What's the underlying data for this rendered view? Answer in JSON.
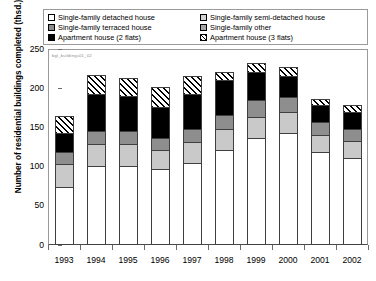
{
  "legend": {
    "items": [
      {
        "label": "Single-family detached house",
        "key": "detached",
        "swatch": "white-square-icon"
      },
      {
        "label": "Single-family semi-detached house",
        "key": "semi",
        "swatch": "light-gray-square-icon"
      },
      {
        "label": "Single-family terraced house",
        "key": "terraced",
        "swatch": "dark-gray-square-icon"
      },
      {
        "label": "Single-family other",
        "key": "other",
        "swatch": "medium-gray-square-icon"
      },
      {
        "label": "Apartment house (2 flats)",
        "key": "apt2",
        "swatch": "black-square-icon"
      },
      {
        "label": "Apartment house (3 flats)",
        "key": "apt3",
        "swatch": "hatched-square-icon"
      }
    ]
  },
  "watermark": "bgl_buildings01_02",
  "colors": {
    "detached": "#ffffff",
    "semi": "#c9c9c9",
    "terraced": "#8e8e8e",
    "other": "#a8a8a8",
    "apt2": "#000000",
    "apt3": "#ffffff",
    "outline": "#3f3f3f",
    "frame": "#9a9a9a"
  },
  "chart_data": {
    "type": "bar",
    "title": "",
    "xlabel": "",
    "ylabel": "Number of residential buildings completed (thsd.)",
    "ylim": [
      0,
      250
    ],
    "yticks": [
      0,
      50,
      100,
      150,
      200,
      250
    ],
    "grid": false,
    "stacked": true,
    "legend_position": "top",
    "categories": [
      "1993",
      "1994",
      "1995",
      "1996",
      "1997",
      "1998",
      "1999",
      "2000",
      "2001",
      "2002"
    ],
    "series": [
      {
        "name": "Single-family detached house",
        "values": [
          73,
          100,
          100,
          95,
          103,
          120,
          135,
          142,
          118,
          110
        ]
      },
      {
        "name": "Single-family semi-detached house",
        "values": [
          30,
          28,
          28,
          25,
          27,
          27,
          28,
          27,
          22,
          22
        ]
      },
      {
        "name": "Single-family terraced house",
        "values": [
          15,
          17,
          17,
          16,
          17,
          18,
          21,
          19,
          16,
          16
        ]
      },
      {
        "name": "Single-family other",
        "values": [
          0,
          0,
          0,
          0,
          0,
          0,
          0,
          0,
          0,
          0
        ]
      },
      {
        "name": "Apartment house (2 flats)",
        "values": [
          25,
          47,
          45,
          40,
          45,
          45,
          37,
          28,
          22,
          22
        ]
      },
      {
        "name": "Apartment house (3 flats)",
        "values": [
          22,
          25,
          23,
          26,
          24,
          11,
          11,
          11,
          8,
          8
        ]
      }
    ],
    "totals": [
      165,
      217,
      213,
      202,
      216,
      221,
      232,
      227,
      186,
      178
    ]
  }
}
